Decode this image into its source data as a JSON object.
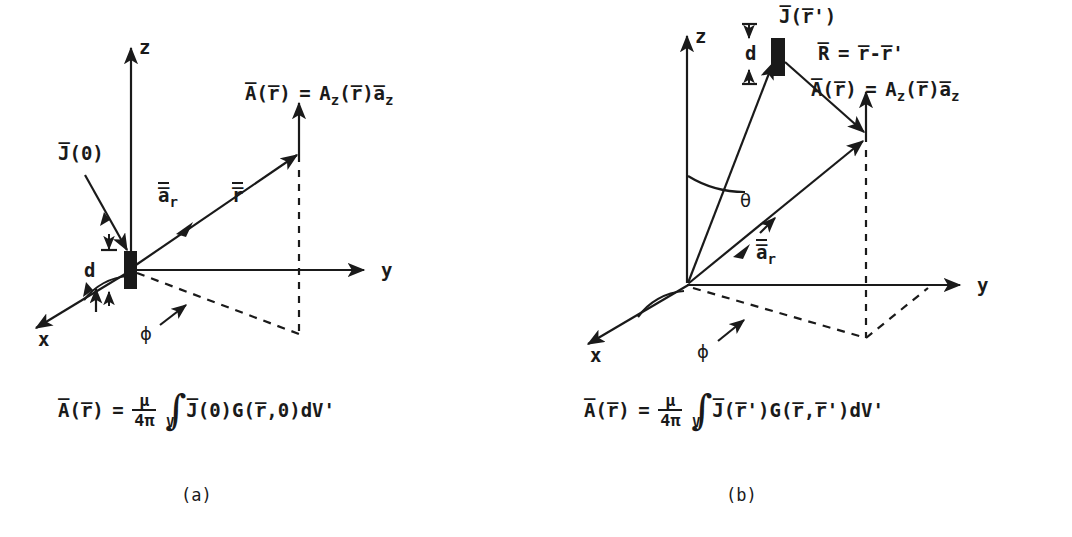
{
  "figure": {
    "background_color": "#ffffff",
    "ink_color": "#1a1a1a"
  },
  "panels": [
    {
      "id": "a",
      "caption": "(a)",
      "axes": {
        "x": "x",
        "y": "y",
        "z": "z"
      },
      "angles": {
        "phi": "ϕ"
      },
      "labels": {
        "source": "J̅(0)",
        "element_length": "d",
        "unit_radial": "a̅",
        "unit_radial_sub": "r",
        "position_vector": "r̅",
        "potential_lhs_A": "A̅",
        "potential_lhs_arg": "(r̅)",
        "potential_eq": "=",
        "potential_rhs_A": "A",
        "potential_rhs_sub": "z",
        "potential_rhs_arg": "(r̅)",
        "potential_rhs_unit": "a̅",
        "potential_rhs_unit_sub": "z"
      },
      "equation": {
        "lhs_symbol": "A̅",
        "lhs_arg": "(r̅)",
        "equals": "=",
        "fraction_num": "μ",
        "fraction_den": "4π",
        "integral_limit": "V",
        "integrand": "J̅(0)G(r̅,0)dV'"
      }
    },
    {
      "id": "b",
      "caption": "(b)",
      "axes": {
        "x": "x",
        "y": "y",
        "z": "z"
      },
      "angles": {
        "phi": "ϕ",
        "theta": "θ"
      },
      "labels": {
        "source": "J̅(r̅')",
        "element_length": "d",
        "unit_radial": "a̅",
        "unit_radial_sub": "r",
        "separation_lhs": "R̅",
        "separation_eq": "=",
        "separation_rhs": "r̅-r̅'",
        "potential_lhs_A": "A̅",
        "potential_lhs_arg": "(r̅)",
        "potential_eq": "=",
        "potential_rhs_A": "A",
        "potential_rhs_sub": "z",
        "potential_rhs_arg": "(r̅)",
        "potential_rhs_unit": "a̅",
        "potential_rhs_unit_sub": "z"
      },
      "equation": {
        "lhs_symbol": "A̅",
        "lhs_arg": "(r̅)",
        "equals": "=",
        "fraction_num": "μ",
        "fraction_den": "4π",
        "integral_limit": "V",
        "integrand": "J̅(r̅')G(r̅,r̅')dV'"
      }
    }
  ]
}
